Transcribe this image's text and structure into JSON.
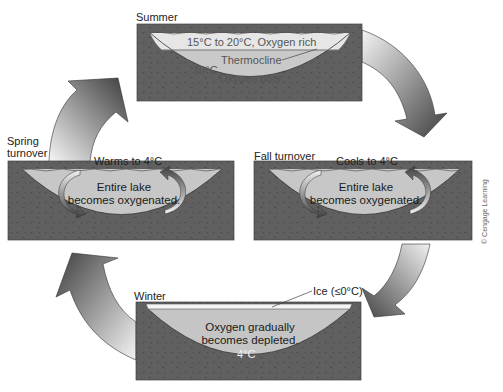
{
  "diagram": {
    "credit": "© Cengage Learning",
    "colors": {
      "ground": "#5f5f5f",
      "water_light": "#cfcfcf",
      "water_warm": "#e4e4e4",
      "water_mid": "#bdbdbd",
      "arrow_dark": "#4a4a4a",
      "arrow_light": "#f0f0f0"
    },
    "panels": {
      "summer": {
        "title": "Summer",
        "top_layer": "15°C to 20°C, Oxygen rich",
        "thermocline": "Thermocline",
        "bottom_temp": "10°C",
        "bottom_layer": "Oxygen poor"
      },
      "fall": {
        "title": "Fall turnover",
        "surface_note": "Cools to 4°C",
        "body_line1": "Entire lake",
        "body_line2": "becomes oxygenated."
      },
      "winter": {
        "title": "Winter",
        "ice_label": "Ice (≤0°C)",
        "body_line1": "Oxygen gradually",
        "body_line2": "becomes depleted.",
        "bottom_temp": "4°C"
      },
      "spring": {
        "title_line1": "Spring",
        "title_line2": "turnover",
        "surface_note": "Warms to 4°C",
        "body_line1": "Entire lake",
        "body_line2": "becomes oxygenated."
      }
    },
    "cycle_order": [
      "Summer",
      "Fall turnover",
      "Winter",
      "Spring turnover"
    ]
  }
}
